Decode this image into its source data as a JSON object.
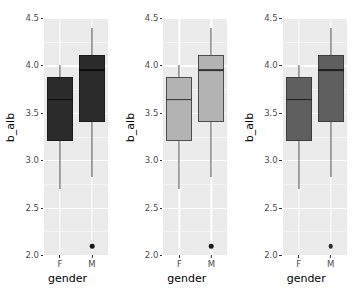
{
  "figure": {
    "panel_count": 3,
    "background": "#ffffff",
    "panel_background": "#ebebeb",
    "gridline_color": "#ffffff",
    "axis_text_color": "#4d4d4d",
    "axis_title_color": "#000000"
  },
  "chart_data": {
    "type": "box",
    "title": "",
    "subtitle": "",
    "xlabel": "gender",
    "ylabel": "b_alb",
    "categories": [
      "F",
      "M"
    ],
    "ylim": [
      2.0,
      4.5
    ],
    "yticks": [
      "4.5",
      "4.0",
      "3.5",
      "3.0",
      "2.5",
      "2.0"
    ],
    "ytick_values": [
      4.5,
      4.0,
      3.5,
      3.0,
      2.5,
      2.0
    ],
    "yminor_values": [
      4.25,
      3.75,
      3.25,
      2.75,
      2.25
    ],
    "grid": true,
    "legend": "none",
    "legend_position": "none",
    "panels": [
      {
        "name": "panel-dark",
        "fill": "#2b2b2b",
        "border": "#1a1a1a",
        "median_color": "#0d0d0d",
        "whisker_color": "#4d4d4d",
        "outlier_color": "#1a1a1a"
      },
      {
        "name": "panel-light",
        "fill": "#b3b3b3",
        "border": "#4d4d4d",
        "median_color": "#333333",
        "whisker_color": "#4d4d4d",
        "outlier_color": "#1a1a1a"
      },
      {
        "name": "panel-medium",
        "fill": "#5f5f5f",
        "border": "#3d3d3d",
        "median_color": "#1f1f1f",
        "whisker_color": "#4d4d4d",
        "outlier_color": "#2b2b2b"
      }
    ],
    "boxes": [
      {
        "category": "F",
        "lower_whisker": 2.7,
        "q1": 3.2,
        "median": 3.64,
        "q3": 3.88,
        "upper_whisker": 4.0,
        "outliers": []
      },
      {
        "category": "M",
        "lower_whisker": 2.82,
        "q1": 3.4,
        "median": 3.95,
        "q3": 4.11,
        "upper_whisker": 4.39,
        "outliers": [
          2.09
        ]
      }
    ]
  }
}
